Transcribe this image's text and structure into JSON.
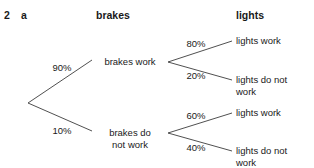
{
  "question": {
    "number": "2",
    "part": "a"
  },
  "headers": {
    "level1": "brakes",
    "level2": "lights"
  },
  "diagram": {
    "type": "probability-tree",
    "root": {
      "x": 28,
      "y": 103
    },
    "branches": [
      {
        "id": "brakes-work",
        "probability": "90%",
        "label": "brakes work",
        "label_lines": [
          "brakes work"
        ],
        "node": {
          "x": 168,
          "y": 62
        },
        "children": [
          {
            "id": "brakes-work-lights-work",
            "probability": "80%",
            "label": "lights work",
            "label_lines": [
              "lights work"
            ]
          },
          {
            "id": "brakes-work-lights-not-work",
            "probability": "20%",
            "label": "lights do not work",
            "label_lines": [
              "lights do not",
              "work"
            ]
          }
        ]
      },
      {
        "id": "brakes-not-work",
        "probability": "10%",
        "label": "brakes do not work",
        "label_lines": [
          "brakes do",
          "not work"
        ],
        "node": {
          "x": 168,
          "y": 133
        },
        "children": [
          {
            "id": "brakes-not-work-lights-work",
            "probability": "60%",
            "label": "lights work",
            "label_lines": [
              "lights work"
            ]
          },
          {
            "id": "brakes-not-work-lights-not-work",
            "probability": "40%",
            "label": "lights do not work",
            "label_lines": [
              "lights do not",
              "work"
            ]
          }
        ]
      }
    ],
    "colors": {
      "line": "#3c3c3c",
      "text": "#1a1a1a",
      "background": "#ffffff"
    }
  }
}
